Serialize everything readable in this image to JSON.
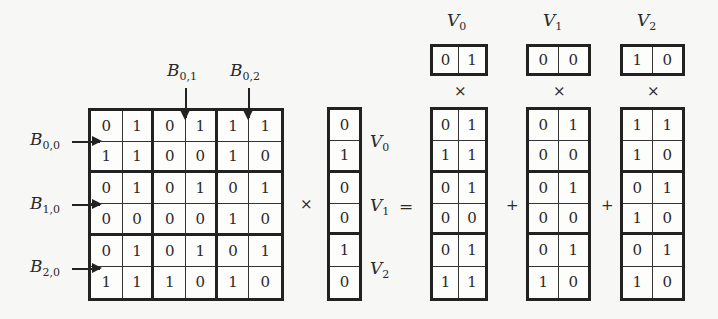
{
  "matrix": {
    "rows": [
      [
        "0",
        "1",
        "0",
        "1",
        "1",
        "1"
      ],
      [
        "1",
        "1",
        "0",
        "0",
        "1",
        "0"
      ],
      [
        "0",
        "1",
        "0",
        "1",
        "0",
        "1"
      ],
      [
        "0",
        "0",
        "0",
        "0",
        "1",
        "0"
      ],
      [
        "0",
        "1",
        "0",
        "1",
        "0",
        "1"
      ],
      [
        "1",
        "1",
        "1",
        "0",
        "1",
        "0"
      ]
    ],
    "block_labels": {
      "b00": {
        "base": "B",
        "sub": "0,0"
      },
      "b10": {
        "base": "B",
        "sub": "1,0"
      },
      "b20": {
        "base": "B",
        "sub": "2,0"
      },
      "b01": {
        "base": "B",
        "sub": "0,1"
      },
      "b02": {
        "base": "B",
        "sub": "0,2"
      }
    }
  },
  "vector": {
    "values": [
      "0",
      "1",
      "0",
      "0",
      "1",
      "0"
    ],
    "labels": [
      {
        "base": "V",
        "sub": "0"
      },
      {
        "base": "V",
        "sub": "1"
      },
      {
        "base": "V",
        "sub": "2"
      }
    ]
  },
  "operators": {
    "times": "×",
    "equals": "=",
    "plus": "+"
  },
  "decomposition": [
    {
      "label": {
        "base": "V",
        "sub": "0"
      },
      "top": [
        "0",
        "1"
      ],
      "column_block": [
        [
          "0",
          "1"
        ],
        [
          "1",
          "1"
        ],
        [
          "0",
          "1"
        ],
        [
          "0",
          "0"
        ],
        [
          "0",
          "1"
        ],
        [
          "1",
          "1"
        ]
      ]
    },
    {
      "label": {
        "base": "V",
        "sub": "1"
      },
      "top": [
        "0",
        "0"
      ],
      "column_block": [
        [
          "0",
          "1"
        ],
        [
          "0",
          "0"
        ],
        [
          "0",
          "1"
        ],
        [
          "0",
          "0"
        ],
        [
          "0",
          "1"
        ],
        [
          "1",
          "0"
        ]
      ]
    },
    {
      "label": {
        "base": "V",
        "sub": "2"
      },
      "top": [
        "1",
        "0"
      ],
      "column_block": [
        [
          "1",
          "1"
        ],
        [
          "1",
          "0"
        ],
        [
          "0",
          "1"
        ],
        [
          "1",
          "0"
        ],
        [
          "0",
          "1"
        ],
        [
          "1",
          "0"
        ]
      ]
    }
  ]
}
